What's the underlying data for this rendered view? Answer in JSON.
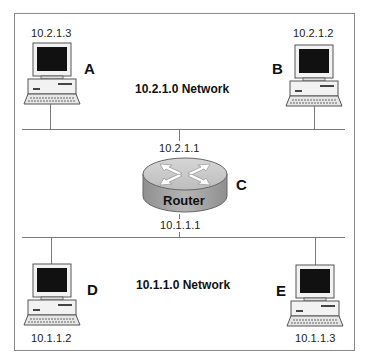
{
  "networks": {
    "top": {
      "label": "10.2.1.0 Network"
    },
    "bottom": {
      "label": "10.1.1.0 Network"
    }
  },
  "hosts": [
    {
      "id": "A",
      "ip": "10.2.1.3",
      "icon": "computer-icon"
    },
    {
      "id": "B",
      "ip": "10.2.1.2",
      "icon": "computer-icon"
    },
    {
      "id": "D",
      "ip": "10.1.1.2",
      "icon": "computer-icon"
    },
    {
      "id": "E",
      "ip": "10.1.1.3",
      "icon": "computer-icon"
    }
  ],
  "router": {
    "id": "C",
    "label": "Router",
    "icon": "router-icon",
    "ip_top": "10.2.1.1",
    "ip_bottom": "10.1.1.1"
  },
  "colors": {
    "line": "#7a7a7a",
    "screen": "#111111",
    "router_top": "#c9c9c9",
    "router_side": "#9a9a9a"
  }
}
